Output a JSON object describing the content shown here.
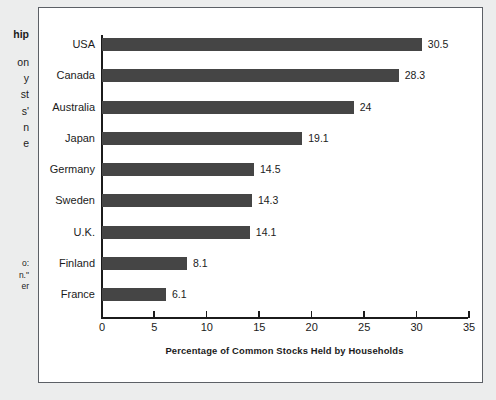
{
  "page": {
    "background_color": "#eceded",
    "frame_border_color": "#5c6066",
    "frame_background": "#ffffff"
  },
  "sidebar": {
    "heading_fragment": "hip",
    "body_fragments": [
      "on",
      "y",
      "st",
      "s'",
      "n",
      "e"
    ],
    "source_fragments": [
      "o:",
      "n.\"",
      "er"
    ]
  },
  "chart_data": {
    "type": "bar",
    "orientation": "horizontal",
    "title": "",
    "xlabel": "Percentage of Common Stocks Held by Households",
    "ylabel": "",
    "xlim": [
      0,
      35
    ],
    "xticks": [
      0,
      5,
      10,
      15,
      20,
      25,
      30,
      35
    ],
    "xtick_labels": [
      "0",
      "5",
      "10",
      "15",
      "20",
      "25",
      "30",
      "35"
    ],
    "grid": false,
    "legend": null,
    "bar_color": "#454545",
    "value_labels_shown": true,
    "categories": [
      "USA",
      "Canada",
      "Australia",
      "Japan",
      "Germany",
      "Sweden",
      "U.K.",
      "Finland",
      "France"
    ],
    "values": [
      30.5,
      28.3,
      24,
      19.1,
      14.5,
      14.3,
      14.1,
      8.1,
      6.1
    ],
    "value_label_text": [
      "30.5",
      "28.3",
      "24",
      "19.1",
      "14.5",
      "14.3",
      "14.1",
      "8.1",
      "6.1"
    ]
  }
}
